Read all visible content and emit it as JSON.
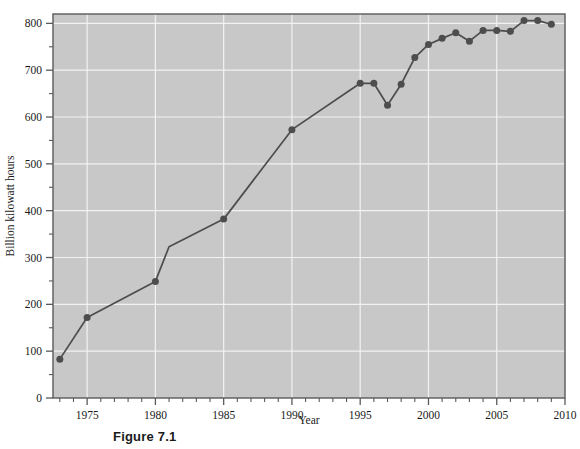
{
  "figure": {
    "caption": "Figure 7.1"
  },
  "chart_data": {
    "type": "line",
    "title": "",
    "xlabel": "Year",
    "ylabel": "Billion kilowatt hours",
    "xlim": [
      1972.5,
      2010
    ],
    "ylim": [
      0,
      820
    ],
    "grid": true,
    "legend": "none",
    "x_ticks": [
      1975,
      1980,
      1985,
      1990,
      1995,
      2000,
      2005,
      2010
    ],
    "x_tick_labels": [
      "1975",
      "1980",
      "1985",
      "1990",
      "1995",
      "2000",
      "2005",
      "2010"
    ],
    "x_minor_tick_step": 1,
    "y_ticks": [
      0,
      100,
      200,
      300,
      400,
      500,
      600,
      700,
      800
    ],
    "y_tick_labels": [
      "0",
      "100",
      "200",
      "300",
      "400",
      "500",
      "600",
      "700",
      "800"
    ],
    "y_minor_tick_step": 50,
    "series": [
      {
        "name": "Nuclear electricity generation",
        "x": [
          1973,
          1975,
          1980,
          1981,
          1985,
          1990,
          1995,
          1996,
          1997,
          1998,
          1999,
          2000,
          2001,
          2002,
          2003,
          2004,
          2005,
          2006,
          2007,
          2008,
          2009
        ],
        "values": [
          83,
          172,
          249,
          323,
          382,
          573,
          672,
          672,
          625,
          670,
          727,
          755,
          768,
          780,
          762,
          785,
          785,
          783,
          806,
          806,
          798
        ],
        "markers": [
          true,
          true,
          true,
          false,
          true,
          true,
          true,
          true,
          true,
          true,
          true,
          true,
          true,
          true,
          true,
          true,
          true,
          true,
          true,
          true,
          true
        ],
        "color": "#4d4d4d",
        "marker_color": "#4d4d4d"
      }
    ],
    "colors": {
      "plot_background": "#c8c8c8",
      "gridline": "#f2f2f2",
      "axis_line": "#5a5a5a",
      "line": "#4d4d4d",
      "marker": "#4d4d4d",
      "text": "#1a1a1a"
    }
  }
}
